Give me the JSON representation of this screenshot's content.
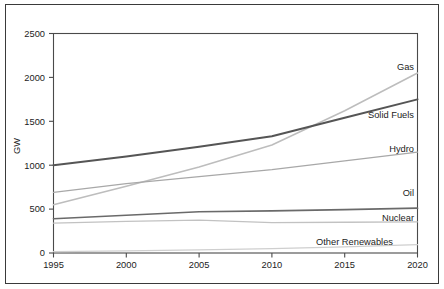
{
  "chart_data": {
    "type": "line",
    "title": "",
    "subtitle": "",
    "xlabel": "",
    "ylabel": "GW",
    "xlim": [
      1995,
      2020
    ],
    "ylim": [
      0,
      2500
    ],
    "grid": false,
    "legend_position": "inline-right-of-line-ends",
    "x": [
      1995,
      2000,
      2005,
      2010,
      2015,
      2020
    ],
    "xtick_labels": [
      "1995",
      "2000",
      "2005",
      "2010",
      "2015",
      "2020"
    ],
    "ytick_values": [
      0,
      500,
      1000,
      1500,
      2000,
      2500
    ],
    "ytick_labels": [
      "0",
      "500",
      "1000",
      "1500",
      "2000",
      "2500"
    ],
    "series": [
      {
        "name": "Gas",
        "label": "Gas",
        "color": "#bdbdbd",
        "width": 1.5,
        "values": [
          550,
          760,
          980,
          1230,
          1620,
          2050
        ]
      },
      {
        "name": "Solid Fuels",
        "label": "Solid Fuels",
        "color": "#555555",
        "width": 2.0,
        "values": [
          1000,
          1100,
          1210,
          1330,
          1540,
          1750
        ]
      },
      {
        "name": "Hydro",
        "label": "Hydro",
        "color": "#a8a8a8",
        "width": 1.3,
        "values": [
          690,
          790,
          870,
          950,
          1050,
          1150
        ]
      },
      {
        "name": "Oil",
        "label": "Oil",
        "color": "#6a6a6a",
        "width": 1.7,
        "values": [
          390,
          430,
          470,
          480,
          495,
          510
        ]
      },
      {
        "name": "Nuclear",
        "label": "Nuclear",
        "color": "#c2c2c2",
        "width": 1.3,
        "values": [
          340,
          360,
          375,
          345,
          350,
          355
        ]
      },
      {
        "name": "Other Renewables",
        "label": "Other Renewables",
        "color": "#cfcfcf",
        "width": 1.3,
        "values": [
          15,
          25,
          35,
          50,
          70,
          95
        ]
      }
    ]
  },
  "labels": {
    "gas": "Gas",
    "solid_fuels": "Solid Fuels",
    "hydro": "Hydro",
    "oil": "Oil",
    "nuclear": "Nuclear",
    "other_renewables": "Other Renewables",
    "y_axis_title": "GW",
    "y_2500": "2500",
    "y_2000": "2000",
    "y_1500": "1500",
    "y_1000": "1000",
    "y_500": "500",
    "y_0": "0",
    "x_1995": "1995",
    "x_2000": "2000",
    "x_2005": "2005",
    "x_2010": "2010",
    "x_2015": "2015",
    "x_2020": "2020"
  }
}
